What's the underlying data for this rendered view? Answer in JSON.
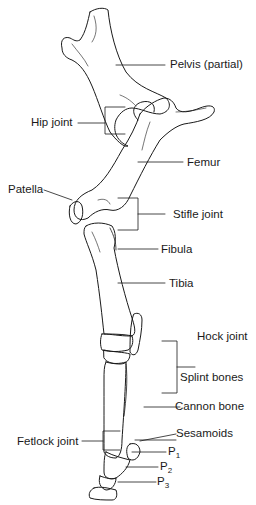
{
  "labels": {
    "pelvis": "Pelvis (partial)",
    "hip_joint": "Hip joint",
    "femur": "Femur",
    "patella": "Patella",
    "stifle_joint": "Stifle joint",
    "fibula": "Fibula",
    "tibia": "Tibia",
    "hock_joint": "Hock joint",
    "splint_bones": "Splint bones",
    "cannon_bone": "Cannon bone",
    "fetlock_joint": "Fetlock joint",
    "sesamoids": "Sesamoids",
    "p1": "P",
    "p1_sub": "1",
    "p2": "P",
    "p2_sub": "2",
    "p3": "P",
    "p3_sub": "3"
  },
  "colors": {
    "line": "#1a1a1a",
    "background": "#ffffff"
  }
}
